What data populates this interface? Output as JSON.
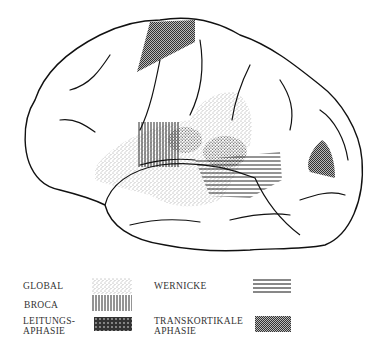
{
  "figure": {
    "regions": [
      {
        "id": "global",
        "pattern": "stipple"
      },
      {
        "id": "broca",
        "pattern": "vertical-lines"
      },
      {
        "id": "leitungsaphasie",
        "pattern": "crosshatch"
      },
      {
        "id": "wernicke",
        "pattern": "horizontal-lines"
      },
      {
        "id": "transkortikale",
        "pattern": "dense-dots"
      }
    ]
  },
  "legend": {
    "items": [
      {
        "label": "GLOBAL",
        "pattern": "stipple"
      },
      {
        "label": "BROCA",
        "pattern": "vertical-lines"
      },
      {
        "label_line1": "LEITUNGS-",
        "label_line2": "APHASIE",
        "pattern": "crosshatch"
      },
      {
        "label": "WERNICKE",
        "pattern": "horizontal-lines"
      },
      {
        "label_line1": "TRANSKORTIKALE",
        "label_line2": "APHASIE",
        "pattern": "dense-dots"
      }
    ]
  },
  "colors": {
    "ink": "#111111",
    "dense_fill": "#777777",
    "background": "#ffffff"
  }
}
